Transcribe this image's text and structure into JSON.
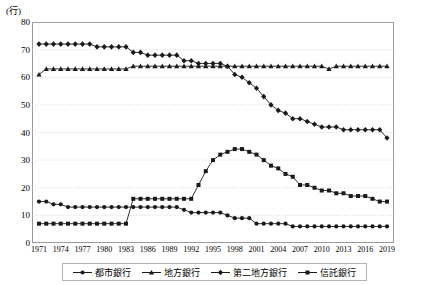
{
  "chart_data": {
    "type": "line",
    "title": "",
    "xlabel": "",
    "ylabel": "(行)",
    "unit_label": "(行)",
    "ylim": [
      0,
      80
    ],
    "ytick_step": 10,
    "yticks": [
      0,
      10,
      20,
      30,
      40,
      50,
      60,
      70,
      80
    ],
    "grid": true,
    "grid_style": "horizontal dotted",
    "legend_position": "bottom",
    "x_start": 1971,
    "x_end": 2019,
    "xticks": [
      1971,
      1974,
      1977,
      1980,
      1983,
      1986,
      1989,
      1992,
      1995,
      1998,
      2001,
      2004,
      2007,
      2010,
      2013,
      2016,
      2019
    ],
    "x": [
      1971,
      1972,
      1973,
      1974,
      1975,
      1976,
      1977,
      1978,
      1979,
      1980,
      1981,
      1982,
      1983,
      1984,
      1985,
      1986,
      1987,
      1988,
      1989,
      1990,
      1991,
      1992,
      1993,
      1994,
      1995,
      1996,
      1997,
      1998,
      1999,
      2000,
      2001,
      2002,
      2003,
      2004,
      2005,
      2006,
      2007,
      2008,
      2009,
      2010,
      2011,
      2012,
      2013,
      2014,
      2015,
      2016,
      2017,
      2018,
      2019
    ],
    "series": [
      {
        "name": "都市銀行",
        "marker": "circle",
        "color": "#1a1a1a",
        "values": [
          15,
          15,
          14,
          14,
          13,
          13,
          13,
          13,
          13,
          13,
          13,
          13,
          13,
          13,
          13,
          13,
          13,
          13,
          13,
          13,
          12,
          11,
          11,
          11,
          11,
          11,
          10,
          9,
          9,
          9,
          7,
          7,
          7,
          7,
          7,
          6,
          6,
          6,
          6,
          6,
          6,
          6,
          6,
          6,
          6,
          6,
          6,
          6,
          6
        ]
      },
      {
        "name": "地方銀行",
        "marker": "triangle",
        "color": "#1a1a1a",
        "values": [
          61,
          63,
          63,
          63,
          63,
          63,
          63,
          63,
          63,
          63,
          63,
          63,
          63,
          64,
          64,
          64,
          64,
          64,
          64,
          64,
          64,
          64,
          64,
          64,
          64,
          64,
          64,
          64,
          64,
          64,
          64,
          64,
          64,
          64,
          64,
          64,
          64,
          64,
          64,
          64,
          63,
          64,
          64,
          64,
          64,
          64,
          64,
          64,
          64
        ]
      },
      {
        "name": "第二地方銀行",
        "marker": "diamond",
        "color": "#1a1a1a",
        "values": [
          72,
          72,
          72,
          72,
          72,
          72,
          72,
          72,
          71,
          71,
          71,
          71,
          71,
          69,
          69,
          68,
          68,
          68,
          68,
          68,
          66,
          66,
          65,
          65,
          65,
          65,
          64,
          61,
          60,
          58,
          56,
          53,
          50,
          48,
          47,
          45,
          45,
          44,
          43,
          42,
          42,
          42,
          41,
          41,
          41,
          41,
          41,
          41,
          38
        ]
      },
      {
        "name": "信託銀行",
        "marker": "square",
        "color": "#1a1a1a",
        "values": [
          7,
          7,
          7,
          7,
          7,
          7,
          7,
          7,
          7,
          7,
          7,
          7,
          7,
          16,
          16,
          16,
          16,
          16,
          16,
          16,
          16,
          16,
          21,
          26,
          30,
          32,
          33,
          34,
          34,
          33,
          32,
          30,
          28,
          27,
          25,
          24,
          21,
          21,
          20,
          19,
          19,
          18,
          18,
          17,
          17,
          17,
          16,
          15,
          15
        ]
      }
    ]
  }
}
